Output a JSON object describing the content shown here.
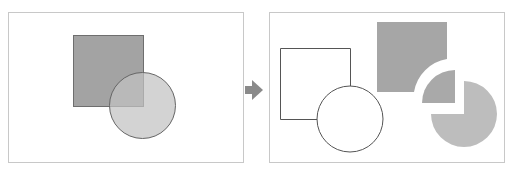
{
  "diagram": {
    "colors": {
      "background": "#ffffff",
      "panel_border": "#c8c8c8",
      "square_fill": "#a3a3a3",
      "circle_fill": "#c2c2c2",
      "overlap_fill": "#aeaeae",
      "outline_stroke": "#555555",
      "arrow": "#8a8a8a",
      "piece_square": "#a6a6a6",
      "piece_overlap": "#a9a9a9",
      "piece_circle": "#bdbdbd"
    },
    "before_panel": {
      "label": "before",
      "shapes": [
        "filled-square",
        "filled-circle-overlapping"
      ]
    },
    "arrow": {
      "direction": "right"
    },
    "after_panel": {
      "label": "after",
      "shapes": [
        "outline-square",
        "outline-circle",
        "square-minus-circle-piece",
        "intersection-quarter-piece",
        "circle-minus-square-piece"
      ]
    }
  }
}
